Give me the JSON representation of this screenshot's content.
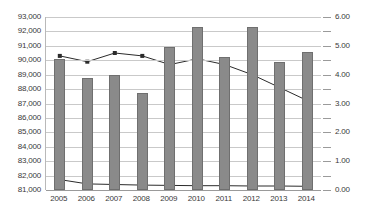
{
  "chart_data": {
    "type": "bar",
    "title": "",
    "subtitle": "",
    "xlabel": "",
    "ylabel": "",
    "grid": true,
    "legend": "none",
    "categories": [
      "2005",
      "2006",
      "2007",
      "2008",
      "2009",
      "2010",
      "2011",
      "2012",
      "2013",
      "2014"
    ],
    "axes": {
      "left": {
        "label": "",
        "min": 81000,
        "max": 93000,
        "step": 1000,
        "ticks": [
          "81,000",
          "82,000",
          "83,000",
          "84,000",
          "85,000",
          "86,000",
          "87,000",
          "88,000",
          "89,000",
          "90,000",
          "91,000",
          "92,000",
          "93,000"
        ],
        "tick_values": [
          81000,
          82000,
          83000,
          84000,
          85000,
          86000,
          87000,
          88000,
          89000,
          90000,
          91000,
          92000,
          93000
        ]
      },
      "right": {
        "label": "",
        "min": 0.0,
        "max": 6.0,
        "step": 1.0,
        "ticks": [
          "0.00",
          "1.00",
          "2.00",
          "3.00",
          "4.00",
          "5.00",
          "6.00"
        ],
        "tick_values": [
          0.0,
          1.0,
          2.0,
          3.0,
          4.0,
          5.0,
          6.0
        ]
      }
    },
    "series": [
      {
        "name": "bars",
        "type": "bar",
        "axis": "left",
        "color": "#8a8a8a",
        "values": [
          90100,
          88750,
          89000,
          87700,
          90950,
          92300,
          90200,
          92300,
          89900,
          90600
        ]
      },
      {
        "name": "upper-line",
        "type": "line",
        "axis": "right",
        "color": "#2b2b2b",
        "values": [
          4.65,
          4.45,
          4.75,
          4.65,
          4.35,
          4.55,
          4.35,
          4.0,
          3.55,
          3.1
        ]
      },
      {
        "name": "lower-line",
        "type": "line",
        "axis": "right",
        "color": "#2b2b2b",
        "values": [
          0.36,
          0.21,
          0.19,
          0.17,
          0.16,
          0.15,
          0.15,
          0.14,
          0.14,
          0.13
        ]
      }
    ]
  },
  "colors": {
    "bar_fill": "#8a8a8a",
    "bar_stroke": "#6f6f6f",
    "line": "#2b2b2b",
    "gridline": "#c9c9c9",
    "axis": "#9a9a9a",
    "tick_text": "#3a3a3a",
    "background": "#ffffff"
  }
}
